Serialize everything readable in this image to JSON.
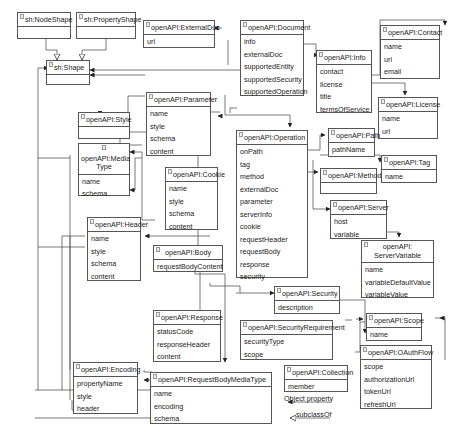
{
  "classes": {
    "nodeShape": {
      "title": "sh:NodeShape",
      "attrs": []
    },
    "propertyShape": {
      "title": "sh:PropertyShape",
      "attrs": []
    },
    "shape": {
      "title": "sh:Shape",
      "attrs": []
    },
    "externalDoc": {
      "title": "openAPI:ExternalDoc",
      "attrs": [
        "url"
      ]
    },
    "document": {
      "title": "openAPI:Document",
      "attrs": [
        "info",
        "externalDoc",
        "supportedEntity",
        "supportedSecurity",
        "supportedOperation"
      ]
    },
    "info": {
      "title": "openAPI:Info",
      "attrs": [
        "contact",
        "license",
        "title",
        "termsOfService"
      ]
    },
    "contact": {
      "title": "openAPI:Contact",
      "attrs": [
        "name",
        "url",
        "email"
      ]
    },
    "license": {
      "title": "openAPI:License",
      "attrs": [
        "name",
        "url"
      ]
    },
    "style": {
      "title": "openAPI:Style",
      "attrs": []
    },
    "parameter": {
      "title": "openAPI:Parameter",
      "attrs": [
        "name",
        "style",
        "schema",
        "content"
      ]
    },
    "mediaType": {
      "title": "openAPI:Media Type",
      "attrs": [
        "name",
        "schema"
      ]
    },
    "cookie": {
      "title": "openAPI:Cookie",
      "attrs": [
        "name",
        "style",
        "schema",
        "content"
      ]
    },
    "operation": {
      "title": "openAPI:Operation",
      "attrs": [
        "onPath",
        "tag",
        "method",
        "externalDoc",
        "parameter",
        "serverInfo",
        "cookie",
        "requestHeader",
        "requestBody",
        "response",
        "security"
      ]
    },
    "path": {
      "title": "openAPI:Path",
      "attrs": [
        "pathName"
      ]
    },
    "method": {
      "title": "openAPI:Method",
      "attrs": []
    },
    "tag": {
      "title": "openAPI:Tag",
      "attrs": [
        "name"
      ]
    },
    "server": {
      "title": "openAPI:Server",
      "attrs": [
        "host",
        "variable"
      ]
    },
    "serverVariable": {
      "title": "openAPI: ServerVariable",
      "attrs": [
        "name",
        "variableDefaultValue",
        "variableValue"
      ]
    },
    "header": {
      "title": "openAPI:Header",
      "attrs": [
        "name",
        "style",
        "schema",
        "content"
      ]
    },
    "body": {
      "title": "openAPI:Body",
      "attrs": [
        "requestBodyContent"
      ]
    },
    "response": {
      "title": "openAPI:Response",
      "attrs": [
        "statusCode",
        "responseHeader",
        "content"
      ]
    },
    "security": {
      "title": "openAPI:Security",
      "attrs": [
        "description"
      ]
    },
    "securityRequirement": {
      "title": "openAPI:SecurityRequirement",
      "attrs": [
        "securityType",
        "scope"
      ]
    },
    "scope": {
      "title": "openAPI:Scope",
      "attrs": [
        "name"
      ]
    },
    "oauthFlow": {
      "title": "openAPI:OAuthFlow",
      "attrs": [
        "scope",
        "authorizationUrl",
        "tokenUrl",
        "refreshUrl"
      ]
    },
    "encoding": {
      "title": "openAPI:Encoding",
      "attrs": [
        "propertyName",
        "style",
        "header"
      ]
    },
    "requestBodyMediaType": {
      "title": "openAPI:RequestBodyMediaType",
      "attrs": [
        "name",
        "encoding",
        "schema"
      ]
    },
    "collection": {
      "title": "openAPI:Collection",
      "attrs": [
        "member"
      ]
    }
  },
  "legend": {
    "objectProperty": "Object property",
    "subclassOf": "subclassOf"
  },
  "colors": {
    "line": "#555555",
    "border": "#555555",
    "background": "#ffffff"
  }
}
